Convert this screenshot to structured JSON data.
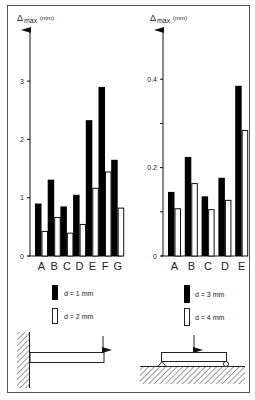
{
  "chart_data": [
    {
      "type": "bar",
      "title": "",
      "ylabel": "Δmax (mm)",
      "ylabel_main": "Δ",
      "ylabel_sub": "max",
      "ylabel_unit": "(mm)",
      "xlabel": "",
      "categories": [
        "A",
        "B",
        "C",
        "D",
        "E",
        "F",
        "G"
      ],
      "series": [
        {
          "name": "d = 1 mm",
          "fill": "#000000",
          "values": [
            0.9,
            1.31,
            0.85,
            1.05,
            2.33,
            2.9,
            1.65
          ]
        },
        {
          "name": "d = 2 mm",
          "fill": "#ffffff",
          "values": [
            0.43,
            0.67,
            0.4,
            0.55,
            1.17,
            1.45,
            0.83
          ]
        }
      ],
      "yticks": [
        0,
        1,
        2,
        3
      ],
      "ytick_labels": [
        "0",
        "1",
        "2",
        "3"
      ],
      "ylim": [
        0,
        3.8
      ],
      "grid": false,
      "legend_position": "below",
      "support_diagram": "cantilever beam with end point load"
    },
    {
      "type": "bar",
      "title": "",
      "ylabel": "Δmax (mm)",
      "ylabel_main": "Δ",
      "ylabel_sub": "max",
      "ylabel_unit": "(mm)",
      "xlabel": "",
      "categories": [
        "A",
        "B",
        "C",
        "D",
        "E"
      ],
      "series": [
        {
          "name": "d = 3 mm",
          "fill": "#000000",
          "values": [
            0.145,
            0.224,
            0.135,
            0.177,
            0.385
          ]
        },
        {
          "name": "d = 4 mm",
          "fill": "#ffffff",
          "values": [
            0.108,
            0.165,
            0.106,
            0.127,
            0.285
          ]
        }
      ],
      "yticks": [
        0,
        0.1,
        0.2,
        0.3,
        0.4
      ],
      "ytick_labels": [
        "0",
        "",
        "0.2",
        "",
        "0.4"
      ],
      "ylim": [
        0,
        0.5
      ],
      "grid": false,
      "legend_position": "below",
      "support_diagram": "simply supported beam with central point load"
    }
  ]
}
